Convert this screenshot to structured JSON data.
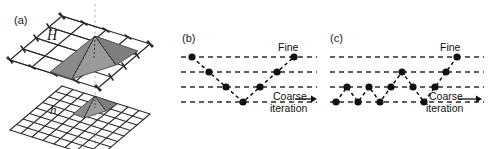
{
  "figure": {
    "panels": [
      {
        "id": "a",
        "label": "(a)",
        "kind": "grid-basis-functions",
        "grids": [
          {
            "name": "coarse-grid",
            "label": "H",
            "divisions": 4,
            "nodes_per_side": 5,
            "basis_span": 2
          },
          {
            "name": "fine-grid",
            "label": "h",
            "divisions": 8,
            "nodes_per_side": 9,
            "basis_span": 1
          }
        ],
        "alignment_line": {
          "name": "apex-alignment-line",
          "style": "dotted",
          "color": "#c8c8c8"
        }
      },
      {
        "id": "b",
        "label": "(b)",
        "kind": "cycle-schedule",
        "fine_label": "Fine",
        "coarse_label": "Coarse",
        "iteration_label": "iteration"
      },
      {
        "id": "c",
        "label": "(c)",
        "kind": "cycle-schedule",
        "fine_label": "Fine",
        "coarse_label": "Coarse",
        "iteration_label": "iteration"
      }
    ]
  },
  "chart_data": [
    {
      "type": "line",
      "name": "v-cycle-schedule",
      "panel": "b",
      "title": "",
      "xlabel": "iteration",
      "ylabel": "",
      "levels": [
        1,
        2,
        3,
        4
      ],
      "level_names": [
        "Fine",
        "",
        "",
        "Coarse"
      ],
      "grid": true,
      "gridline_style": "dashed",
      "legend": "none",
      "x": [
        1,
        2,
        3,
        4,
        5,
        6,
        7
      ],
      "values": [
        1,
        2,
        3,
        4,
        3,
        2,
        1
      ],
      "marker": "filled-circle",
      "linestyle": "dashed",
      "color": "#111111"
    },
    {
      "type": "line",
      "name": "full-multigrid-schedule",
      "panel": "c",
      "title": "",
      "xlabel": "iteration",
      "ylabel": "",
      "levels": [
        1,
        2,
        3,
        4
      ],
      "level_names": [
        "Fine",
        "",
        "",
        "Coarse"
      ],
      "grid": true,
      "gridline_style": "dashed",
      "legend": "none",
      "x": [
        1,
        2,
        3,
        4,
        5,
        6,
        7,
        8,
        9,
        10,
        11,
        12
      ],
      "values": [
        4,
        3,
        4,
        3,
        4,
        3,
        2,
        3,
        4,
        3,
        2,
        1
      ],
      "marker": "filled-circle",
      "linestyle": "dashed",
      "color": "#111111"
    }
  ],
  "colors": {
    "background": "#ffffff",
    "ink": "#111111",
    "grid_line": "#2b2b2b",
    "basis_fill": "#8c8c8c",
    "basis_fill_dark": "#6e6e6e",
    "dashed_level": "#2b2b2b",
    "alignment": "#c9c9c9"
  }
}
